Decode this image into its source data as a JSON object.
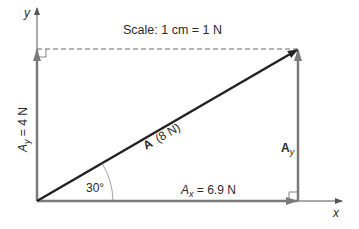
{
  "diagram": {
    "scale_label": "Scale: 1 cm = 1 N",
    "axes": {
      "x_label": "x",
      "y_label": "y"
    },
    "vector_A": {
      "name": "A",
      "magnitude": "(8 N)"
    },
    "component_x": {
      "name": "A",
      "sub": "x",
      "value": " = 6.9 N"
    },
    "component_y_left": {
      "name": "A",
      "sub": "y",
      "value": " = 4 N"
    },
    "component_y_right": {
      "name": "A",
      "sub": "y"
    },
    "angle_label": "30°",
    "colors": {
      "resultant": "#222222",
      "components": "#7a7a7a",
      "axes": "#555555",
      "dashed": "#666666"
    }
  }
}
